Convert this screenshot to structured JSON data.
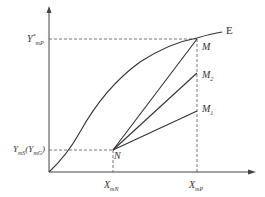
{
  "diagram": {
    "type": "equilibrium-operating-line diagram",
    "curve": {
      "label": "E"
    },
    "points": {
      "M": {
        "label": "M"
      },
      "M2": {
        "label": "M",
        "sub": "2"
      },
      "M1": {
        "label": "M",
        "sub": "1"
      },
      "N": {
        "label": "N"
      }
    },
    "y_labels": {
      "top": {
        "base": "Y",
        "sup": "*",
        "sub": "mP"
      },
      "bottom": {
        "base": "Y",
        "sub": "mS",
        "paren_base": "Y",
        "paren_sub": "mG"
      }
    },
    "x_labels": {
      "left": {
        "base": "X",
        "sub": "mN"
      },
      "right": {
        "base": "X",
        "sub": "mP"
      }
    },
    "colors": {
      "line": "#333333",
      "axis": "#444444",
      "dashed": "#555555",
      "background": "#ffffff"
    }
  }
}
